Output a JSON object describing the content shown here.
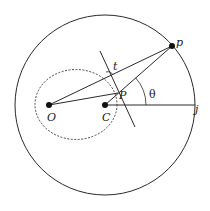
{
  "diagram": {
    "type": "geometry",
    "colors": {
      "stroke": "#2a2a2a",
      "background": "#ffffff"
    },
    "outer_circle": {
      "cx": 105,
      "cy": 105,
      "r": 90
    },
    "ellipse": {
      "cx": 76,
      "cy": 104.5,
      "rx": 41,
      "ry": 35,
      "style": "dashed"
    },
    "points": {
      "O": {
        "x": 49,
        "y": 105,
        "label": "O"
      },
      "C": {
        "x": 105,
        "y": 105,
        "label": "C"
      },
      "P": {
        "x": 118,
        "y": 93,
        "label": "P"
      },
      "p": {
        "x": 172,
        "y": 46,
        "label": "p"
      },
      "j": {
        "x": 195,
        "y": 105,
        "label": "j"
      }
    },
    "labels": {
      "O": "O",
      "C": "C",
      "P": "P",
      "p": "p",
      "j": "j",
      "t": "t",
      "theta": "θ"
    },
    "edges": [
      {
        "from": "O",
        "to": "p"
      },
      {
        "from": "O",
        "to": "P"
      },
      {
        "from": "C",
        "to": "p"
      },
      {
        "from": "C",
        "to": "j"
      }
    ],
    "tangent_line": {
      "x1": 100,
      "y1": 51,
      "x2": 135,
      "y2": 127
    },
    "angle_arc": {
      "center": "C",
      "r": 41,
      "label": "θ"
    }
  }
}
